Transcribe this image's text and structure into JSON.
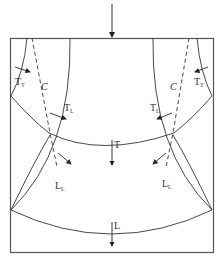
{
  "diagram": {
    "labels": {
      "top_left_tt": {
        "main": "T",
        "sub": "T"
      },
      "top_right_tt": {
        "main": "T",
        "sub": "T"
      },
      "left_c": "C",
      "right_c": "C",
      "left_tl": {
        "main": "T",
        "sub": "L"
      },
      "right_tl": {
        "main": "T",
        "sub": "L"
      },
      "left_ll": {
        "main": "L",
        "sub": "L"
      },
      "right_ll": {
        "main": "L",
        "sub": "L"
      },
      "center_t": "T",
      "center_l": "L"
    },
    "colors": {
      "line": "#333333",
      "border": "#555555",
      "background": "#ffffff"
    }
  }
}
